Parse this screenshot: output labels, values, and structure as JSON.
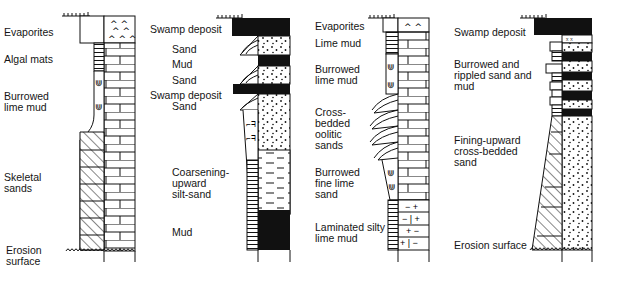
{
  "diagram": {
    "type": "stratigraphic-columns",
    "columns": [
      {
        "id": "carbonate-shoaling",
        "labels": [
          {
            "text": "Evaporites",
            "x": 4,
            "y": 27
          },
          {
            "text": "Algal mats",
            "x": 4,
            "y": 54
          },
          {
            "text": "Burrowed\nlime mud",
            "x": 4,
            "y": 91
          },
          {
            "text": "Skeletal\nsands",
            "x": 4,
            "y": 172
          },
          {
            "text": "Erosion\nsurface",
            "x": 6,
            "y": 245
          }
        ]
      },
      {
        "id": "deltaic-coarsening",
        "labels": [
          {
            "text": "Swamp deposit",
            "x": 150,
            "y": 24
          },
          {
            "text": "Sand",
            "x": 172,
            "y": 44
          },
          {
            "text": "Mud",
            "x": 172,
            "y": 59
          },
          {
            "text": "Sand",
            "x": 172,
            "y": 75
          },
          {
            "text": "Swamp deposit",
            "x": 150,
            "y": 90
          },
          {
            "text": "Sand",
            "x": 172,
            "y": 101
          },
          {
            "text": "Coarsening-\nupward\nsilt-sand",
            "x": 172,
            "y": 167
          },
          {
            "text": "Mud",
            "x": 172,
            "y": 227
          }
        ]
      },
      {
        "id": "oolitic-shoal",
        "labels": [
          {
            "text": "Evaporites",
            "x": 315,
            "y": 21
          },
          {
            "text": "Lime mud",
            "x": 315,
            "y": 38
          },
          {
            "text": "Burrowed\nlime mud",
            "x": 315,
            "y": 64
          },
          {
            "text": "Cross-\nbedded\noolitic\nsands",
            "x": 315,
            "y": 107
          },
          {
            "text": "Burrowed\nfine lime\nsand",
            "x": 315,
            "y": 167
          },
          {
            "text": "Laminated silty\nlime mud",
            "x": 315,
            "y": 222
          }
        ]
      },
      {
        "id": "fluvial-fining",
        "labels": [
          {
            "text": "Swamp deposit",
            "x": 454,
            "y": 27
          },
          {
            "text": "Burrowed and\nrippled sand and\nmud",
            "x": 454,
            "y": 59
          },
          {
            "text": "Fining-upward\ncross-bedded\nsand",
            "x": 454,
            "y": 135
          },
          {
            "text": "Erosion surface",
            "x": 454,
            "y": 240
          }
        ]
      }
    ]
  }
}
